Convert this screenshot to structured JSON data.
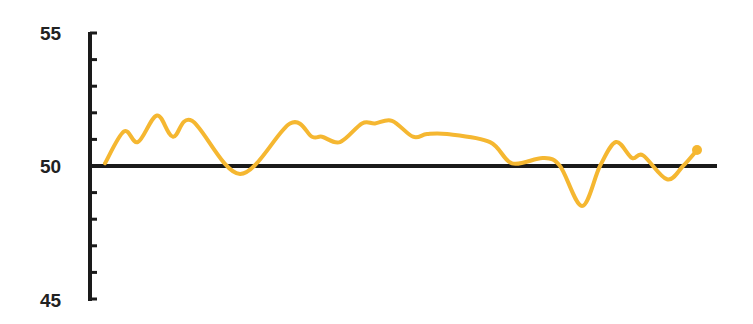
{
  "chart_data": {
    "type": "line",
    "title": "",
    "xlabel": "",
    "ylabel": "",
    "ylim": [
      45,
      55
    ],
    "y_ticks_labeled": [
      55,
      50,
      45
    ],
    "y_minor_tick_step": 1,
    "baseline": 50,
    "grid": false,
    "legend": null,
    "series": [
      {
        "name": "value",
        "color": "#F5B731",
        "end_marker": true,
        "x": [
          0,
          1,
          2,
          3,
          4,
          5,
          6,
          7,
          8,
          9,
          10,
          11,
          12,
          13,
          14,
          15,
          16,
          17,
          18,
          19,
          20,
          21,
          22,
          23,
          24,
          25,
          26,
          27,
          28
        ],
        "values": [
          50.1,
          51.3,
          50.9,
          51.9,
          51.1,
          51.7,
          49.7,
          51.6,
          51.1,
          51.1,
          50.9,
          51.6,
          51.6,
          51.7,
          51.1,
          51.2,
          51.2,
          50.9,
          50.1,
          50.3,
          50.0,
          48.5,
          50.0,
          50.9,
          50.3,
          50.4,
          49.5,
          50.0,
          50.6
        ]
      }
    ]
  },
  "axis": {
    "labels": {
      "top": "55",
      "middle": "50",
      "bottom": "45"
    }
  },
  "colors": {
    "line": "#F5B731",
    "axis": "#1a1a1a",
    "label": "#222222"
  }
}
